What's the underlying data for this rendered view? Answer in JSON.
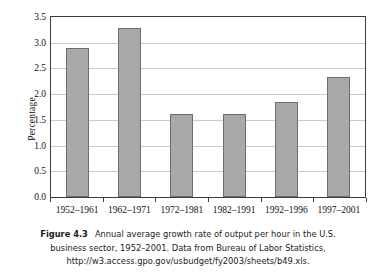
{
  "chart_data": {
    "type": "bar",
    "title": "",
    "xlabel": "",
    "ylabel": "Percentage",
    "categories": [
      "1952–1961",
      "1962–1971",
      "1972–1981",
      "1982–1991",
      "1992–1996",
      "1997–2001"
    ],
    "values": [
      2.89,
      3.29,
      1.62,
      1.61,
      1.84,
      2.33
    ],
    "ylim": [
      0.0,
      3.5
    ],
    "ytick_labels": [
      "0.0",
      "0.5",
      "1.0",
      "1.5",
      "2.0",
      "2.5",
      "3.0",
      "3.5"
    ],
    "ytick_values": [
      0.0,
      0.5,
      1.0,
      1.5,
      2.0,
      2.5,
      3.0,
      3.5
    ],
    "grid": true,
    "legend": false,
    "series": [
      {
        "name": "Annual average growth rate of output per hour",
        "values": [
          2.89,
          3.29,
          1.62,
          1.61,
          1.84,
          2.33
        ]
      }
    ],
    "bar_fill_color": "#a9a9a9",
    "bar_border_color": "#6d6d6d",
    "gridline_color": "#c9c9c9",
    "axis_color": "#3d3d3d",
    "background_color": "#ffffff"
  },
  "caption": {
    "figure_number": "Figure 4.3",
    "text": "Annual average growth rate of output per hour in the U.S. business sector, 1952–2001. Data from Bureau of Labor Statistics, http://w3.access.gpo.gov/usbudget/fy2003/sheets/b49.xls."
  }
}
